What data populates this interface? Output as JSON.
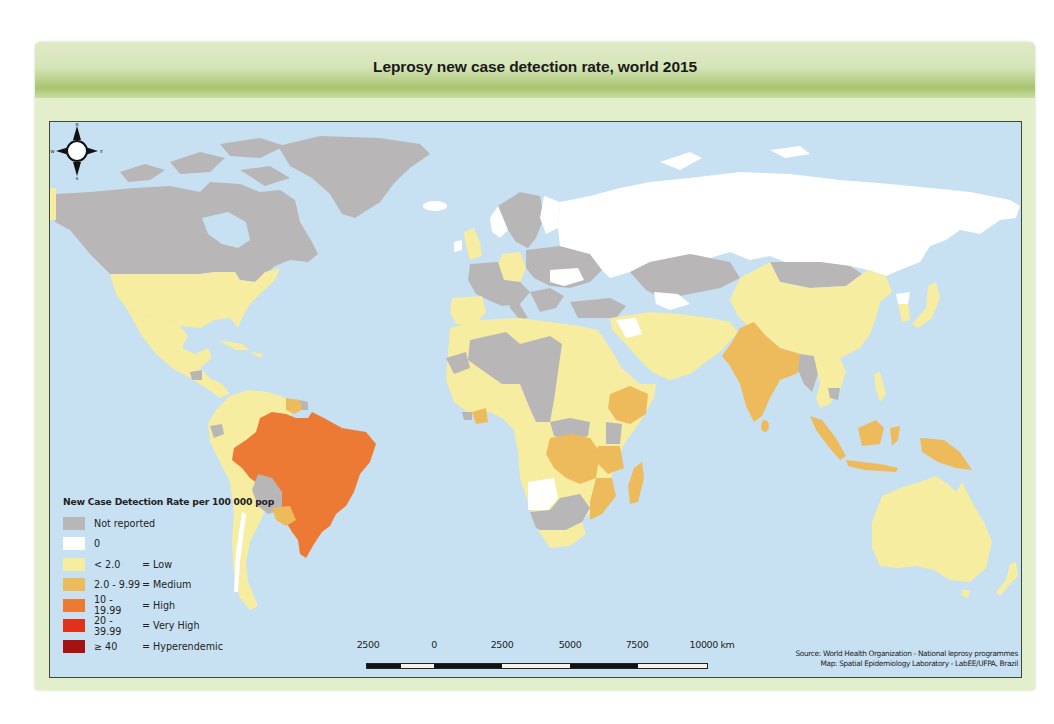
{
  "title": "Leprosy new case detection rate, world 2015",
  "colors": {
    "panel_background": "#e3eecb",
    "ocean": "#c7e1f3",
    "not_reported": "#b9b6b8",
    "zero": "#ffffff",
    "low": "#f6eda0",
    "medium": "#eebb5c",
    "high": "#ec7a35",
    "very_high": "#e0311b",
    "hyperendemic": "#a51212"
  },
  "legend": {
    "title": "New Case Detection Rate per 100 000 pop",
    "items": [
      {
        "range": "Not reported",
        "level": "",
        "color": "#b9b6b8"
      },
      {
        "range": "0",
        "level": "",
        "color": "#ffffff"
      },
      {
        "range": "< 2.0",
        "level": "= Low",
        "color": "#f6eda0"
      },
      {
        "range": "2.0 - 9.99",
        "level": "= Medium",
        "color": "#eebb5c"
      },
      {
        "range": "10 - 19.99",
        "level": "= High",
        "color": "#ec7a35"
      },
      {
        "range": "20 - 39.99",
        "level": "= Very High",
        "color": "#e0311b"
      },
      {
        "range": "≥ 40",
        "level": "= Hyperendemic",
        "color": "#a51212"
      }
    ]
  },
  "scale_bar": {
    "labels": [
      "2500",
      "0",
      "2500",
      "5000",
      "7500",
      "10000 km"
    ],
    "unit": "km"
  },
  "compass": {
    "n": "N",
    "s": "S",
    "e": "E",
    "w": "W"
  },
  "source": {
    "line1": "Source: World Health Organization - National leprosy programmes",
    "line2": "Map: Spatial Epidemiology Laboratory - LabEE/UFPA, Brazil"
  },
  "regions": [
    {
      "name": "Canada",
      "category": "Not reported"
    },
    {
      "name": "Greenland",
      "category": "Not reported"
    },
    {
      "name": "Iceland",
      "category": "0"
    },
    {
      "name": "United States",
      "category": "< 2.0"
    },
    {
      "name": "Mexico",
      "category": "< 2.0"
    },
    {
      "name": "Central America",
      "category": "< 2.0"
    },
    {
      "name": "Brazil",
      "category": "10 - 19.99"
    },
    {
      "name": "Guianas",
      "category": "2.0 - 9.99"
    },
    {
      "name": "Bolivia",
      "category": "Not reported"
    },
    {
      "name": "Paraguay",
      "category": "2.0 - 9.99"
    },
    {
      "name": "Rest of South America",
      "category": "< 2.0"
    },
    {
      "name": "Russia",
      "category": "0"
    },
    {
      "name": "Kazakhstan",
      "category": "Not reported"
    },
    {
      "name": "Mongolia",
      "category": "Not reported"
    },
    {
      "name": "China",
      "category": "< 2.0"
    },
    {
      "name": "India",
      "category": "2.0 - 9.99"
    },
    {
      "name": "Myanmar",
      "category": "Not reported"
    },
    {
      "name": "Indonesia",
      "category": "2.0 - 9.99"
    },
    {
      "name": "Papua New Guinea",
      "category": "2.0 - 9.99"
    },
    {
      "name": "Australia",
      "category": "< 2.0"
    },
    {
      "name": "Ethiopia",
      "category": "2.0 - 9.99"
    },
    {
      "name": "DR Congo",
      "category": "2.0 - 9.99"
    },
    {
      "name": "Mozambique",
      "category": "2.0 - 9.99"
    },
    {
      "name": "Madagascar",
      "category": "2.0 - 9.99"
    },
    {
      "name": "Côte d'Ivoire",
      "category": "2.0 - 9.99"
    },
    {
      "name": "Angola",
      "category": "0"
    },
    {
      "name": "Western Europe",
      "category": "Not reported"
    },
    {
      "name": "Germany",
      "category": "< 2.0"
    },
    {
      "name": "United Kingdom",
      "category": "< 2.0"
    },
    {
      "name": "Iberia",
      "category": "< 2.0"
    }
  ]
}
